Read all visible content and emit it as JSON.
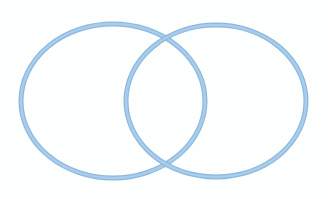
{
  "diagram": {
    "type": "venn",
    "background": "#ffffff",
    "ring_fill": "#a9cdec",
    "ring_edge": "#8db8dd",
    "stroke_width": 5,
    "ellipses": [
      {
        "id": "left",
        "cx": 113,
        "cy": 101,
        "rx": 92,
        "ry": 77
      },
      {
        "id": "right",
        "cx": 216,
        "cy": 101,
        "rx": 90,
        "ry": 76
      }
    ]
  }
}
